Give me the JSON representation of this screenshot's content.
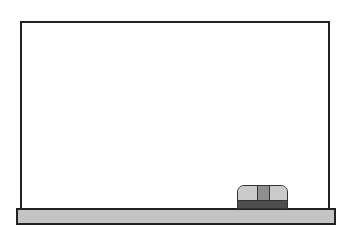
{
  "scene": {
    "label": "Blank whiteboard with eraser on tray",
    "board": {
      "surface_color": "#ffffff",
      "frame_color": "#222222"
    },
    "tray": {
      "color": "#c4c4c4"
    },
    "eraser": {
      "top_color": "#cacaca",
      "stripe_color": "#8f8f8f",
      "base_color": "#4d4d4d"
    }
  }
}
